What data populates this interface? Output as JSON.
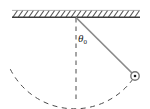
{
  "figure": {
    "kind": "simple-pendulum-diagram",
    "width": 150,
    "height": 109,
    "background_color": "#ffffff"
  },
  "labels": {
    "angle_symbol": "θ",
    "angle_subscript": "0",
    "angle_full": "θ0"
  },
  "colors": {
    "ceiling_line": "#3c3c3c",
    "hatch": "#555555",
    "string": "#8a8a8a",
    "bob_outline": "#6e6e6e",
    "bob_center": "#1a1a1a",
    "dashed": "#4a4a4a"
  },
  "geometry": {
    "ceiling": {
      "x_start": 12,
      "x_end": 140,
      "y_baseline": 17,
      "hatch_height": 7,
      "hatch_count": 24,
      "hatch_lean": "right"
    },
    "pivot": {
      "x": 76,
      "y": 17
    },
    "bob": {
      "x": 135,
      "y": 76,
      "radius": 4.2,
      "center_dot_radius": 1.3
    },
    "vertical_line": {
      "x": 76,
      "y_top": 18,
      "y_bottom": 100
    },
    "arc": {
      "center_x": 76,
      "center_y": 17,
      "radius": 72,
      "left_end_x": 10,
      "left_end_y": 69,
      "bottom_x": 76,
      "bottom_y": 99
    },
    "angle_label_position": {
      "x": 78,
      "y": 33
    }
  }
}
